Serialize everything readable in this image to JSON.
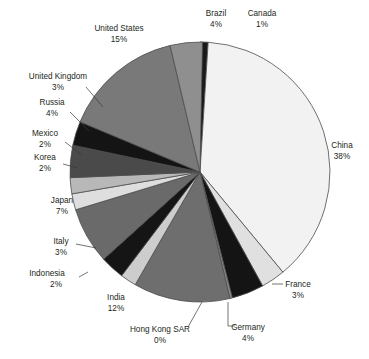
{
  "chart_data": {
    "type": "pie",
    "title": "",
    "subtitle": "",
    "xlabel": "",
    "ylabel": "",
    "legend_position": "none",
    "grid": false,
    "unit": "%",
    "total": 100,
    "start_angle_deg": 0,
    "direction": "clockwise",
    "categories": [
      "Canada",
      "China",
      "France",
      "Germany",
      "Hong Kong SAR",
      "India",
      "Indonesia",
      "Italy",
      "Japan",
      "Korea",
      "Mexico",
      "Russia",
      "United Kingdom",
      "United States",
      "Brazil"
    ],
    "values": [
      1,
      38,
      3,
      4,
      0,
      12,
      2,
      3,
      7,
      2,
      2,
      4,
      3,
      15,
      4
    ],
    "slices": [
      {
        "label": "Canada",
        "pct_text": "1%",
        "value": 1,
        "color": "#1a1a1a",
        "label_x": 262,
        "label_y": 16,
        "pct_x": 262,
        "pct_y": 27,
        "anchor": "middle",
        "leader": null
      },
      {
        "label": "China",
        "pct_text": "38%",
        "value": 38,
        "color": "#f2f2f2",
        "label_x": 342,
        "label_y": 148,
        "pct_x": 342,
        "pct_y": 159,
        "anchor": "middle",
        "leader": null
      },
      {
        "label": "France",
        "pct_text": "3%",
        "value": 3,
        "color": "#e0e0e0",
        "label_x": 298,
        "label_y": 287,
        "pct_x": 298,
        "pct_y": 298,
        "anchor": "middle",
        "leader": [
          [
            272,
            284
          ],
          [
            283,
            284
          ]
        ]
      },
      {
        "label": "Germany",
        "pct_text": "4%",
        "value": 4,
        "color": "#141414",
        "label_x": 248,
        "label_y": 330,
        "pct_x": 248,
        "pct_y": 341,
        "anchor": "middle",
        "leader": [
          [
            228,
            302
          ],
          [
            228,
            326
          ],
          [
            235,
            326
          ]
        ]
      },
      {
        "label": "Hong Kong SAR",
        "pct_text": "0%",
        "value": 0,
        "color": "#8c8c8c",
        "label_x": 160,
        "label_y": 332,
        "pct_x": 160,
        "pct_y": 343,
        "anchor": "middle",
        "leader": [
          [
            202,
            302
          ],
          [
            188,
            327
          ]
        ]
      },
      {
        "label": "India",
        "pct_text": "12%",
        "value": 12,
        "color": "#6e6e6e",
        "label_x": 116,
        "label_y": 300,
        "pct_x": 116,
        "pct_y": 311,
        "anchor": "middle",
        "leader": null
      },
      {
        "label": "Indonesia",
        "pct_text": "2%",
        "value": 2,
        "color": "#cdcdcd",
        "label_x": 47,
        "label_y": 276,
        "pct_x": 56,
        "pct_y": 287,
        "anchor": "middle",
        "leader": [
          [
            88,
            272
          ],
          [
            79,
            277
          ]
        ]
      },
      {
        "label": "Italy",
        "pct_text": "3%",
        "value": 3,
        "color": "#151515",
        "label_x": 61,
        "label_y": 244,
        "pct_x": 61,
        "pct_y": 255,
        "anchor": "middle",
        "leader": [
          [
            96,
            248
          ],
          [
            76,
            244
          ]
        ]
      },
      {
        "label": "Japan",
        "pct_text": "7%",
        "value": 7,
        "color": "#6a6a6a",
        "label_x": 62,
        "label_y": 203,
        "pct_x": 62,
        "pct_y": 214,
        "anchor": "middle",
        "leader": null
      },
      {
        "label": "Korea",
        "pct_text": "2%",
        "value": 2,
        "color": "#dedede",
        "label_x": 45,
        "label_y": 160,
        "pct_x": 45,
        "pct_y": 171,
        "anchor": "middle",
        "leader": [
          [
            78,
            168
          ],
          [
            63,
            164
          ]
        ]
      },
      {
        "label": "Mexico",
        "pct_text": "2%",
        "value": 2,
        "color": "#b8b8b8",
        "label_x": 45,
        "label_y": 136,
        "pct_x": 45,
        "pct_y": 147,
        "anchor": "middle",
        "leader": [
          [
            82,
            155
          ],
          [
            65,
            142
          ]
        ]
      },
      {
        "label": "Russia",
        "pct_text": "4%",
        "value": 4,
        "color": "#4a4a4a",
        "label_x": 52,
        "label_y": 105,
        "pct_x": 52,
        "pct_y": 116,
        "anchor": "middle",
        "leader": [
          [
            89,
            131
          ],
          [
            70,
            112
          ]
        ]
      },
      {
        "label": "United Kingdom",
        "pct_text": "3%",
        "value": 3,
        "color": "#141414",
        "label_x": 58,
        "label_y": 79,
        "pct_x": 58,
        "pct_y": 90,
        "anchor": "middle",
        "leader": [
          [
            103,
            107
          ],
          [
            86,
            87
          ]
        ]
      },
      {
        "label": "United States",
        "pct_text": "15%",
        "value": 15,
        "color": "#797979",
        "label_x": 119,
        "label_y": 31,
        "pct_x": 119,
        "pct_y": 42,
        "anchor": "middle",
        "leader": null
      },
      {
        "label": "Brazil",
        "pct_text": "4%",
        "value": 4,
        "color": "#8f8f8f",
        "label_x": 216,
        "label_y": 16,
        "pct_x": 216,
        "pct_y": 27,
        "anchor": "middle",
        "leader": null
      }
    ],
    "geometry": {
      "cx": 200,
      "cy": 172,
      "r": 130,
      "stroke": "#4d4d4d",
      "stroke_width": 0.8
    }
  }
}
